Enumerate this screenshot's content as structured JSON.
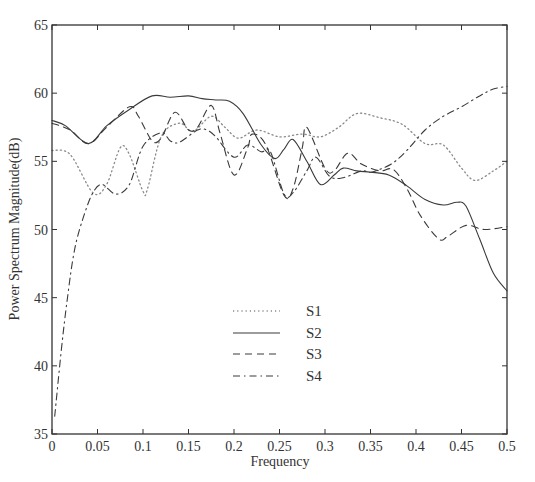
{
  "chart_data": {
    "type": "line",
    "title": "",
    "xlabel": "Frequency",
    "ylabel": "Power Spectrum Magnitude(dB)",
    "xlim": [
      0,
      0.5
    ],
    "ylim": [
      35,
      65
    ],
    "xticks": [
      0,
      0.05,
      0.1,
      0.15,
      0.2,
      0.25,
      0.3,
      0.35,
      0.4,
      0.45,
      0.5
    ],
    "xtick_labels": [
      "0",
      "0.05",
      "0.1",
      "0.15",
      "0.2",
      "0.25",
      "0.3",
      "0.35",
      "0.4",
      "0.45",
      "0.5"
    ],
    "yticks": [
      35,
      40,
      45,
      50,
      55,
      60,
      65
    ],
    "ytick_labels": [
      "35",
      "40",
      "45",
      "50",
      "55",
      "60",
      "65"
    ],
    "grid": false,
    "legend_position": "center-lower",
    "series": [
      {
        "name": "S1",
        "style": "dotted",
        "x": [
          0,
          0.02,
          0.045,
          0.06,
          0.075,
          0.085,
          0.1,
          0.105,
          0.12,
          0.14,
          0.155,
          0.175,
          0.19,
          0.205,
          0.225,
          0.25,
          0.275,
          0.295,
          0.315,
          0.335,
          0.36,
          0.385,
          0.41,
          0.43,
          0.45,
          0.465,
          0.485,
          0.5
        ],
        "values": [
          55.8,
          55.5,
          52.7,
          53.3,
          56.0,
          55.5,
          52.8,
          53.0,
          56.8,
          57.8,
          57.2,
          58.3,
          57.5,
          56.7,
          57.3,
          56.8,
          57.0,
          56.8,
          57.5,
          58.5,
          58.2,
          57.7,
          56.3,
          56.2,
          54.5,
          53.6,
          54.3,
          55.0
        ]
      },
      {
        "name": "S2",
        "style": "solid",
        "x": [
          0,
          0.015,
          0.04,
          0.06,
          0.085,
          0.11,
          0.13,
          0.15,
          0.165,
          0.18,
          0.195,
          0.21,
          0.23,
          0.245,
          0.255,
          0.265,
          0.28,
          0.295,
          0.31,
          0.32,
          0.335,
          0.35,
          0.37,
          0.39,
          0.41,
          0.43,
          0.445,
          0.455,
          0.47,
          0.485,
          0.5
        ],
        "values": [
          58.0,
          57.6,
          56.3,
          57.6,
          58.8,
          59.8,
          59.7,
          59.8,
          59.6,
          59.5,
          59.4,
          58.5,
          56.2,
          55.2,
          55.9,
          56.6,
          55.0,
          53.3,
          54.0,
          54.5,
          54.3,
          54.2,
          54.0,
          53.2,
          52.2,
          51.8,
          52.0,
          51.7,
          49.3,
          46.8,
          45.5
        ]
      },
      {
        "name": "S3",
        "style": "dashed",
        "x": [
          0,
          0.02,
          0.04,
          0.06,
          0.085,
          0.095,
          0.11,
          0.12,
          0.135,
          0.15,
          0.16,
          0.175,
          0.185,
          0.2,
          0.215,
          0.22,
          0.235,
          0.255,
          0.265,
          0.275,
          0.28,
          0.3,
          0.31,
          0.325,
          0.34,
          0.36,
          0.375,
          0.39,
          0.405,
          0.425,
          0.435,
          0.455,
          0.475,
          0.5
        ],
        "values": [
          57.8,
          57.3,
          56.3,
          57.5,
          59.0,
          58.3,
          56.5,
          56.7,
          58.6,
          57.3,
          57.5,
          59.1,
          57.0,
          54.0,
          56.0,
          57.0,
          56.2,
          52.5,
          53.0,
          56.0,
          57.5,
          54.5,
          54.3,
          55.6,
          54.8,
          54.3,
          54.4,
          53.0,
          51.0,
          49.3,
          49.5,
          50.3,
          50.0,
          50.2
        ]
      },
      {
        "name": "S4",
        "style": "dashdot",
        "x": [
          0.003,
          0.01,
          0.017,
          0.025,
          0.035,
          0.045,
          0.055,
          0.07,
          0.085,
          0.1,
          0.12,
          0.13,
          0.14,
          0.16,
          0.17,
          0.18,
          0.2,
          0.215,
          0.23,
          0.24,
          0.255,
          0.265,
          0.28,
          0.29,
          0.305,
          0.32,
          0.34,
          0.35,
          0.36,
          0.375,
          0.39,
          0.41,
          0.43,
          0.45,
          0.47,
          0.485,
          0.5
        ],
        "values": [
          36.3,
          41.0,
          45.0,
          48.6,
          51.0,
          52.7,
          53.3,
          52.6,
          53.3,
          56.1,
          57.1,
          56.5,
          56.4,
          57.3,
          57.3,
          56.8,
          55.3,
          56.2,
          55.7,
          55.7,
          52.6,
          52.7,
          54.3,
          55.3,
          53.9,
          53.8,
          54.3,
          54.2,
          54.4,
          54.9,
          55.8,
          57.3,
          58.3,
          59.0,
          59.8,
          60.3,
          60.5
        ]
      }
    ],
    "legend": [
      {
        "label": "S1",
        "style": "dotted"
      },
      {
        "label": "S2",
        "style": "solid"
      },
      {
        "label": "S3",
        "style": "dashed"
      },
      {
        "label": "S4",
        "style": "dashdot"
      }
    ]
  },
  "colors": {
    "axis": "#333333",
    "line": "#3a3a3a",
    "dotted": "#8a8a8a",
    "background": "#ffffff"
  }
}
